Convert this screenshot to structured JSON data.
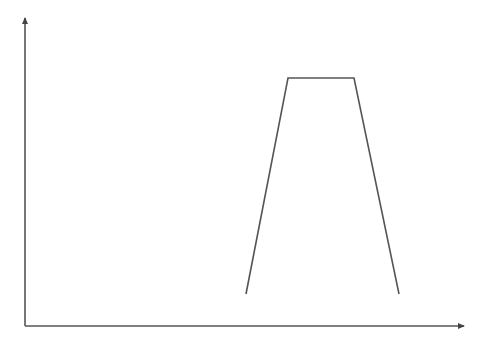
{
  "diagram": {
    "type": "trapezoid-profile",
    "background": "#ffffff",
    "stroke_color": "#555555",
    "stroke_width": 1.6,
    "axes": {
      "origin": [
        25,
        326
      ],
      "y_axis_end": [
        25,
        16
      ],
      "x_axis_end": [
        466,
        326
      ],
      "arrowheads": true,
      "x_label": "",
      "y_label": ""
    },
    "shape": {
      "name": "trapezoid",
      "open_bottom": true,
      "points": [
        [
          246,
          294
        ],
        [
          288,
          78
        ],
        [
          354,
          78
        ],
        [
          399,
          294
        ]
      ]
    }
  }
}
